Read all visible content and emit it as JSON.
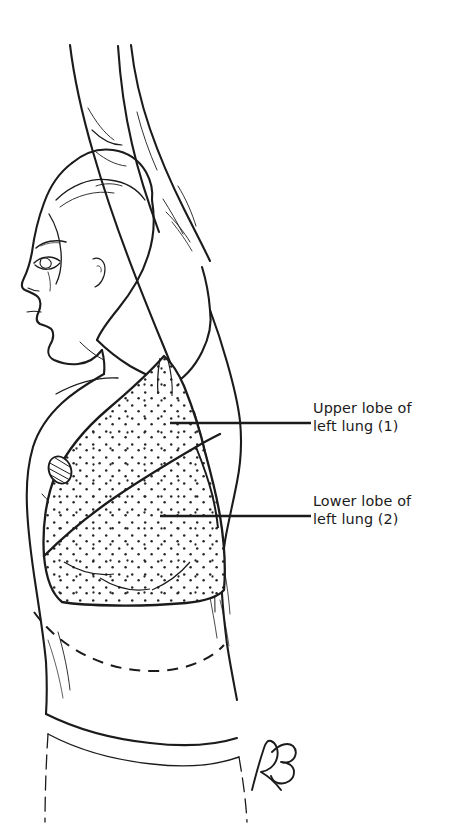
{
  "figure": {
    "subject_description": "Line drawing of a woman in left lateral profile with her left arm raised overhead, showing the surface projection of the left lung",
    "background_color": "#ffffff",
    "ink_color": "#1b1b1b",
    "stipple_color": "#2b2b2b",
    "canvas": {
      "width": 463,
      "height": 838
    }
  },
  "labels": [
    {
      "id": "upper-lobe",
      "line1": "Upper lobe of",
      "line2": "left lung (1)",
      "number": "1",
      "leader": {
        "x1": 170,
        "y1": 423,
        "x2": 311,
        "y2": 423
      }
    },
    {
      "id": "lower-lobe",
      "line1": "Lower lobe of",
      "line2": "left lung (2)",
      "number": "2",
      "leader": {
        "x1": 160,
        "y1": 516,
        "x2": 311,
        "y2": 516
      }
    }
  ],
  "signature": {
    "text": "RB",
    "description": "cursive artist monogram",
    "position": {
      "x": 252,
      "y": 762
    }
  },
  "annotations": {
    "fissure_name": "oblique fissure",
    "diaphragm_line_style": "dashed",
    "lung_fill": "stippled"
  }
}
